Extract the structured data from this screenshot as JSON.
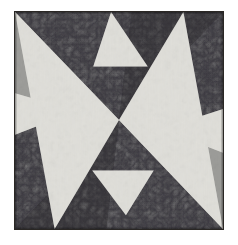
{
  "page": {
    "background_color": "#ffffff",
    "width": 238,
    "height": 245
  },
  "artwork": {
    "name": "eight-point-pinwheel-star",
    "frame": {
      "x": 14,
      "y": 11,
      "width": 210,
      "height": 219,
      "border_color": "#2a2724"
    },
    "palette": {
      "background_dark": "#17161a",
      "background_dark_mottle": "#3a3740",
      "wedge_gray": "#9a9a97",
      "wedge_gray_light": "#a8a8a4",
      "wedge_dark": "#1c1a1e",
      "star_white": "#efeee9",
      "star_white_shadow": "#dcdbd5",
      "border": "#2a2724"
    },
    "geometry": {
      "view_box": "0 0 210 219",
      "center": {
        "x": 105,
        "y": 109
      },
      "shapes": [
        {
          "name": "gray-wedge-upper-left",
          "fill_key": "wedge_gray",
          "points": "0,0 105,109 0,96"
        },
        {
          "name": "gray-wedge-lower-right",
          "fill_key": "wedge_gray",
          "points": "210,219 105,109 210,123"
        },
        {
          "name": "dark-wedge-upper-right",
          "fill_key": "wedge_dark",
          "points": "210,0 105,109 118,0"
        },
        {
          "name": "dark-wedge-lower-left",
          "fill_key": "wedge_dark",
          "points": "0,219 105,109 92,219"
        },
        {
          "name": "white-point-upper-left-corner",
          "fill_key": "star_white",
          "points": "0,0 105,109 40,219"
        },
        {
          "name": "white-point-lower-right-corner",
          "fill_key": "star_white",
          "points": "210,219 105,109 170,0"
        },
        {
          "name": "white-point-top-center",
          "fill_key": "star_white",
          "points": "97,0 79,55 134,55"
        },
        {
          "name": "white-point-bottom-center",
          "fill_key": "star_white",
          "points": "112,205 78,160 140,160"
        },
        {
          "name": "white-point-left-edge",
          "fill_key": "star_white",
          "points": "0,82 62,100 0,124"
        },
        {
          "name": "white-point-right-edge",
          "fill_key": "star_white",
          "points": "210,98 148,118 210,142"
        }
      ]
    },
    "labels": {
      "alt_text": "Abstract eight-pointed star quilt block with white star points over dark mottled ground and gray diagonal wedges"
    }
  }
}
